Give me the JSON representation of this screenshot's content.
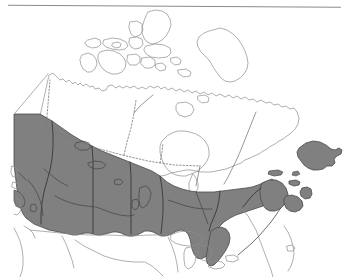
{
  "figure": {
    "width": 349,
    "height": 277,
    "background_color": "#ffffff",
    "top_rule": {
      "name": "horizontal-rule",
      "color": "#8a8a8a",
      "x1": 8,
      "y1": 5,
      "x2": 341,
      "y2": 7
    }
  },
  "legend_colors": {
    "shaded_region_fill": "#808080",
    "shaded_region_stroke": "#4a4a4a",
    "unshaded_region_fill": "#ffffff",
    "coastline_stroke": "#8e8e8e",
    "internal_border_stroke": "#6d6d6d",
    "dotted_border_stroke": "#7a7a7a"
  },
  "map": {
    "country": "Canada",
    "shaded_area_label": "Southern distribution band",
    "regions_shaded": [
      "British Columbia",
      "Alberta",
      "Saskatchewan",
      "Manitoba",
      "Southern Ontario",
      "Southern Quebec",
      "New Brunswick",
      "Nova Scotia",
      "Prince Edward Island",
      "Newfoundland"
    ],
    "regions_unshaded": [
      "Yukon",
      "Northwest Territories",
      "Nunavut",
      "Arctic Archipelago",
      "Northern Quebec",
      "Labrador",
      "Hudson Bay"
    ]
  }
}
